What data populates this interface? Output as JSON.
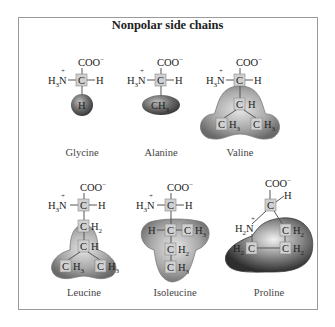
{
  "title": "Nonpolar side chains",
  "common": {
    "carboxylate": "COO",
    "carboxylate_charge": "−",
    "amine_h": "H",
    "amine_sub": "3",
    "amine_n": "N",
    "amine_charge": "+",
    "alpha_c": "C",
    "alpha_h": "H"
  },
  "amino_acids": [
    {
      "name": "Glycine",
      "side_chain": [
        "H"
      ]
    },
    {
      "name": "Alanine",
      "side_chain": [
        "CH3"
      ]
    },
    {
      "name": "Valine",
      "side_chain": [
        "CH",
        "CH3",
        "CH3"
      ]
    },
    {
      "name": "Leucine",
      "side_chain": [
        "CH2",
        "CH",
        "CH3",
        "CH3"
      ]
    },
    {
      "name": "Isoleucine",
      "side_chain": [
        "H",
        "C",
        "CH3",
        "CH2",
        "CH3"
      ]
    },
    {
      "name": "Proline",
      "side_chain": [
        "H2N",
        "CH2",
        "H2C",
        "CH2"
      ]
    }
  ],
  "colors": {
    "blob_light": "#d8d8d8",
    "blob_mid": "#9c9c9c",
    "blob_dark": "#5a5a5a",
    "carbon_box": "#d0d0d0",
    "frame": "#9a9a9a"
  }
}
